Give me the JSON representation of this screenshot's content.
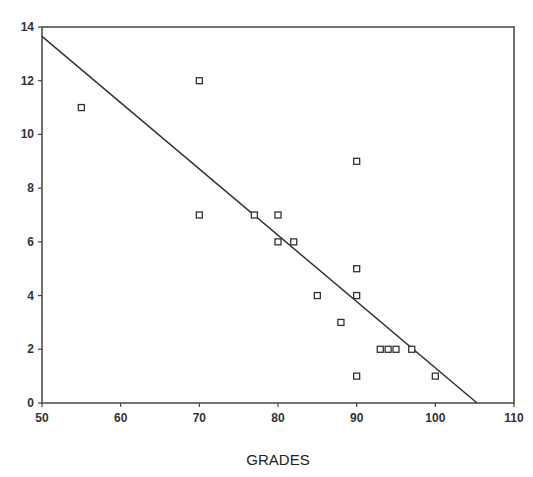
{
  "chart_data": {
    "type": "scatter",
    "title": "",
    "xlabel": "GRADES",
    "ylabel": "",
    "xlim": [
      50,
      110
    ],
    "ylim": [
      0,
      14
    ],
    "x_ticks": [
      50,
      60,
      70,
      80,
      90,
      100,
      110
    ],
    "y_ticks": [
      0,
      2,
      4,
      6,
      8,
      10,
      12,
      14
    ],
    "grid": false,
    "legend": null,
    "series": [
      {
        "name": "observations",
        "marker": "open-square",
        "points": [
          [
            55,
            11
          ],
          [
            70,
            12
          ],
          [
            70,
            7
          ],
          [
            77,
            7
          ],
          [
            80,
            7
          ],
          [
            80,
            6
          ],
          [
            82,
            6
          ],
          [
            85,
            4
          ],
          [
            88,
            3
          ],
          [
            90,
            9
          ],
          [
            90,
            5
          ],
          [
            90,
            4
          ],
          [
            90,
            1
          ],
          [
            93,
            2
          ],
          [
            94,
            2
          ],
          [
            95,
            2
          ],
          [
            97,
            2
          ],
          [
            100,
            1
          ]
        ]
      }
    ],
    "fit_line": {
      "type": "linear",
      "x": [
        50,
        105.3
      ],
      "y": [
        13.65,
        0
      ]
    }
  },
  "plot": {
    "frame": {
      "left": 42,
      "top": 27,
      "right": 514,
      "bottom": 403
    },
    "line_color": "#333333",
    "marker_color": "#333333"
  }
}
